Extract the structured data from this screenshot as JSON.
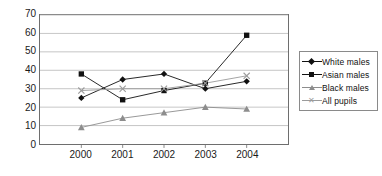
{
  "ghost_text": "· · ·",
  "legend": {
    "position": "right",
    "items": [
      {
        "label": "White males",
        "marker": "diamond",
        "color": "#111111"
      },
      {
        "label": "Asian males",
        "marker": "square",
        "color": "#111111"
      },
      {
        "label": "Black males",
        "marker": "triangle",
        "color": "#8d8d8d"
      },
      {
        "label": "All pupils",
        "marker": "cross",
        "color": "#9b9b9b"
      }
    ]
  },
  "chart_data": {
    "type": "line",
    "title": "",
    "xlabel": "",
    "ylabel": "",
    "categories": [
      "2000",
      "2001",
      "2002",
      "2003",
      "2004"
    ],
    "yticks": [
      0,
      10,
      20,
      30,
      40,
      50,
      60,
      70
    ],
    "ylim": [
      0,
      70
    ],
    "grid": true,
    "legend_position": "right",
    "series": [
      {
        "name": "White males",
        "marker": "diamond",
        "color": "#111111",
        "values": [
          25,
          35,
          38,
          30,
          34
        ]
      },
      {
        "name": "Asian males",
        "marker": "square",
        "color": "#111111",
        "values": [
          38,
          24,
          29,
          33,
          59
        ]
      },
      {
        "name": "Black males",
        "marker": "triangle",
        "color": "#8d8d8d",
        "values": [
          9,
          14,
          17,
          20,
          19
        ]
      },
      {
        "name": "All pupils",
        "marker": "cross",
        "color": "#9b9b9b",
        "values": [
          29,
          30,
          30,
          33,
          37
        ]
      }
    ]
  }
}
